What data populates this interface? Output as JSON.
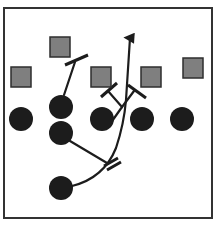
{
  "diagram": {
    "type": "football-play-diagram",
    "frame": {
      "x": 4,
      "y": 8,
      "width": 208,
      "height": 210,
      "stroke": "#333333"
    },
    "colors": {
      "defender_fill": "#7f7f7f",
      "defender_stroke": "#2e2e2e",
      "offense_fill": "#1c1c1c",
      "line": "#1c1c1c",
      "background": "#ffffff"
    },
    "defenders": [
      {
        "id": "d1",
        "shape": "square",
        "x": 50,
        "y": 37,
        "size": 20
      },
      {
        "id": "d2",
        "shape": "square",
        "x": 11,
        "y": 67,
        "size": 20
      },
      {
        "id": "d3",
        "shape": "square",
        "x": 91,
        "y": 67,
        "size": 20
      },
      {
        "id": "d4",
        "shape": "square",
        "x": 141,
        "y": 67,
        "size": 20
      },
      {
        "id": "d5",
        "shape": "square",
        "x": 183,
        "y": 58,
        "size": 20
      }
    ],
    "offense": [
      {
        "id": "o1",
        "shape": "circle",
        "cx": 21,
        "cy": 119,
        "r": 12
      },
      {
        "id": "o2",
        "shape": "circle",
        "cx": 61,
        "cy": 107,
        "r": 12
      },
      {
        "id": "o3",
        "shape": "circle",
        "cx": 61,
        "cy": 133,
        "r": 12
      },
      {
        "id": "o4",
        "shape": "circle",
        "cx": 102,
        "cy": 119,
        "r": 12
      },
      {
        "id": "o5",
        "shape": "circle",
        "cx": 142,
        "cy": 119,
        "r": 12
      },
      {
        "id": "o6",
        "shape": "circle",
        "cx": 182,
        "cy": 119,
        "r": 12
      },
      {
        "id": "o7",
        "shape": "circle",
        "cx": 61,
        "cy": 188,
        "r": 12
      }
    ],
    "routes": [
      {
        "id": "ball-carrier-route",
        "from": "o7",
        "path": "M 72 186 Q 104 178 116 148 Q 124 124 126 100 L 130 38",
        "arrow": true
      },
      {
        "id": "block-o2",
        "from": "o2",
        "path": "M 64 95 L 75 62",
        "block_end": "M 65 65 L 88 55"
      },
      {
        "id": "block-o4-left",
        "from": "o4",
        "path": "M 110 124 L 122 107 L 108 91",
        "block_end": "M 101 97 L 117 83"
      },
      {
        "id": "block-o4-right",
        "from": "o4",
        "path": "M 122 107 L 134 91",
        "block_end": "M 128 85 L 146 98"
      },
      {
        "id": "block-o3",
        "from": "o3",
        "path": "M 70 141 L 107 163",
        "block_end": "M 104 166 L 118 158 M 107 170 L 121 162"
      }
    ]
  }
}
